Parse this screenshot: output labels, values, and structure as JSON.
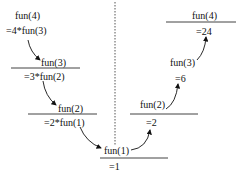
{
  "diagram": {
    "descent": [
      {
        "call": "fun(4)",
        "expr": "=4*fun(3)"
      },
      {
        "call": "fun(3)",
        "expr": "=3*fun(2)"
      },
      {
        "call": "fun(2)",
        "expr": "=2*fun(1)"
      },
      {
        "call": "fun(1)",
        "expr": "=1"
      }
    ],
    "ascent": [
      {
        "call": "fun(2)",
        "result": "=2"
      },
      {
        "call": "fun(3)",
        "result": "=6"
      },
      {
        "call": "fun(4)",
        "result": "=24"
      }
    ],
    "colors": {
      "ink": "#111111",
      "divider": "#555555"
    }
  }
}
